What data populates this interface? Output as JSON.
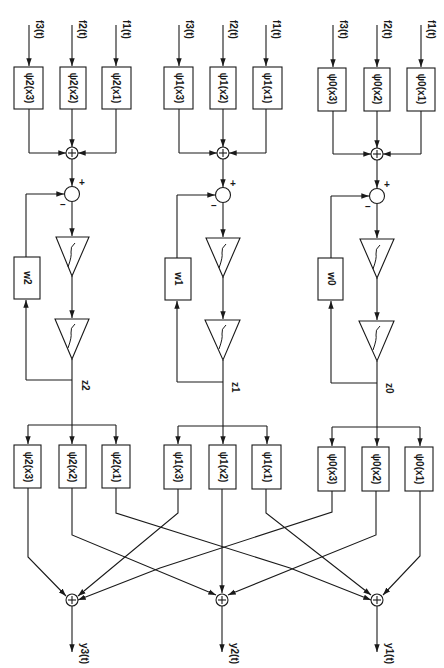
{
  "diagram": {
    "orientation": "rotated 90 degrees clockwise (text reads top-to-bottom)",
    "colors": {
      "line": "#1a1a1a",
      "background": "#ffffff"
    },
    "channels": [
      {
        "index": 2,
        "center_x": 72,
        "inputs": [
          {
            "signal": "f3(t)",
            "box": "ψ2(x3)"
          },
          {
            "signal": "f2(t)",
            "box": "ψ2(x2)"
          },
          {
            "signal": "f1(t)",
            "box": "ψ2(x1)"
          }
        ],
        "sum_symbol": "+",
        "comparator_plus": "+",
        "comparator_minus": "–",
        "integrator_symbol": "∫",
        "feedback_gain": "w2",
        "state": "z2",
        "output_boxes": [
          "ψ2(x3)",
          "ψ2(x2)",
          "ψ2(x1)"
        ],
        "output": "y3(t)"
      },
      {
        "index": 1,
        "center_x": 222,
        "inputs": [
          {
            "signal": "f3(t)",
            "box": "ψ1(x3)"
          },
          {
            "signal": "f2(t)",
            "box": "ψ1(x2)"
          },
          {
            "signal": "f1(t)",
            "box": "ψ1(x1)"
          }
        ],
        "sum_symbol": "+",
        "comparator_plus": "+",
        "comparator_minus": "–",
        "integrator_symbol": "∫",
        "feedback_gain": "w1",
        "state": "z1",
        "output_boxes": [
          "ψ1(x3)",
          "ψ1(x2)",
          "ψ1(x1)"
        ],
        "output": "y2(t)"
      },
      {
        "index": 0,
        "center_x": 378,
        "inputs": [
          {
            "signal": "f3(t)",
            "box": "ψ0(x3)"
          },
          {
            "signal": "f2(t)",
            "box": "ψ0(x2)"
          },
          {
            "signal": "f1(t)",
            "box": "ψ0(x1)"
          }
        ],
        "sum_symbol": "+",
        "comparator_plus": "+",
        "comparator_minus": "–",
        "integrator_symbol": "∫",
        "feedback_gain": "w0",
        "state": "z0",
        "output_boxes": [
          "ψ0(x3)",
          "ψ0(x2)",
          "ψ0(x1)"
        ],
        "output": "y1(t)"
      }
    ],
    "output_summers": [
      {
        "label": "+",
        "output": "y3(t)",
        "sources": [
          "ψ2(x3)",
          "ψ1(x3)",
          "ψ0(x3)"
        ]
      },
      {
        "label": "+",
        "output": "y2(t)",
        "sources": [
          "ψ2(x2)",
          "ψ1(x2)",
          "ψ0(x2)"
        ]
      },
      {
        "label": "+",
        "output": "y1(t)",
        "sources": [
          "ψ2(x1)",
          "ψ1(x1)",
          "ψ0(x1)"
        ]
      }
    ]
  },
  "text": {
    "c2": {
      "f3": "f3(t)",
      "f2": "f2(t)",
      "f1": "f1(t)",
      "in3": "ψ2(x3)",
      "in2": "ψ2(x2)",
      "in1": "ψ2(x1)",
      "w": "w2",
      "z": "z2",
      "out3": "ψ2(x3)",
      "out2": "ψ2(x2)",
      "out1": "ψ2(x1)",
      "y": "y3(t)"
    },
    "c1": {
      "f3": "f3(t)",
      "f2": "f2(t)",
      "f1": "f1(t)",
      "in3": "ψ1(x3)",
      "in2": "ψ1(x2)",
      "in1": "ψ1(x1)",
      "w": "w1",
      "z": "z1",
      "out3": "ψ1(x3)",
      "out2": "ψ1(x2)",
      "out1": "ψ1(x1)",
      "y": "y2(t)"
    },
    "c0": {
      "f3": "f3(t)",
      "f2": "f2(t)",
      "f1": "f1(t)",
      "in3": "ψ0(x3)",
      "in2": "ψ0(x2)",
      "in1": "ψ0(x1)",
      "w": "w0",
      "z": "z0",
      "out3": "ψ0(x3)",
      "out2": "ψ0(x2)",
      "out1": "ψ0(x1)",
      "y": "y1(t)"
    },
    "plus": "+",
    "minus": "–"
  }
}
